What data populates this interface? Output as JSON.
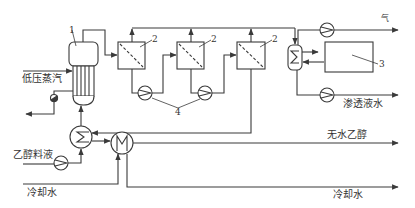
{
  "diagram": {
    "type": "process-flow",
    "colors": {
      "line": "#3a3a3a",
      "background": "#ffffff"
    },
    "labels": {
      "low_pressure_steam": "低压蒸汽",
      "ethanol_feed": "乙醇料液",
      "cooling_water_in": "冷却水",
      "cooling_water_out": "冷却水",
      "anhydrous_ethanol": "无水乙醇",
      "permeate_water": "渗透液水",
      "gas": "气"
    },
    "equipment_numbers": {
      "evaporator": "1",
      "membrane_1": "2",
      "membrane_2": "2",
      "membrane_3": "2",
      "vacuum_tank": "3",
      "pumps": "4"
    },
    "components": [
      {
        "id": "evaporator",
        "number": "1"
      },
      {
        "id": "membrane-module",
        "number": "2",
        "count": 3
      },
      {
        "id": "vacuum-tank",
        "number": "3"
      },
      {
        "id": "circulation-pump",
        "number": "4",
        "count": 2
      },
      {
        "id": "permeate-condenser"
      },
      {
        "id": "vacuum-pump"
      },
      {
        "id": "permeate-pump"
      },
      {
        "id": "feed-preheater"
      },
      {
        "id": "product-cooler"
      },
      {
        "id": "feed-pump"
      },
      {
        "id": "steam-trap"
      }
    ]
  }
}
